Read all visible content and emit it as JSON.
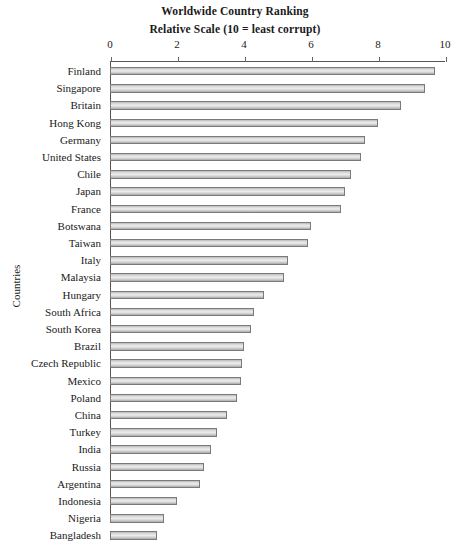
{
  "chart_data": {
    "type": "bar",
    "orientation": "horizontal",
    "title": "Worldwide Country Ranking",
    "subtitle": "Relative Scale (10 = least corrupt)",
    "xlabel": "",
    "ylabel": "Countries",
    "xlim": [
      0,
      10
    ],
    "xticks": [
      0,
      2,
      4,
      6,
      8,
      10
    ],
    "xtick_labels": [
      "0",
      "2",
      "4",
      "6",
      "8",
      "10"
    ],
    "grid": false,
    "legend": null,
    "axis_position": "top",
    "categories": [
      "Finland",
      "Singapore",
      "Britain",
      "Hong Kong",
      "Germany",
      "United States",
      "Chile",
      "Japan",
      "France",
      "Botswana",
      "Taiwan",
      "Italy",
      "Malaysia",
      "Hungary",
      "South Africa",
      "South Korea",
      "Brazil",
      "Czech Republic",
      "Mexico",
      "Poland",
      "China",
      "Turkey",
      "India",
      "Russia",
      "Argentina",
      "Indonesia",
      "Nigeria",
      "Bangladesh"
    ],
    "values": [
      9.7,
      9.4,
      8.7,
      8.0,
      7.6,
      7.5,
      7.2,
      7.0,
      6.9,
      6.0,
      5.9,
      5.3,
      5.2,
      4.6,
      4.3,
      4.2,
      4.0,
      3.95,
      3.9,
      3.8,
      3.5,
      3.2,
      3.0,
      2.8,
      2.7,
      2.0,
      1.6,
      1.4
    ],
    "bar_fill_color": "#dcdcdc",
    "bar_edge_color": "#7a7a7a",
    "background_color": "#ffffff"
  }
}
